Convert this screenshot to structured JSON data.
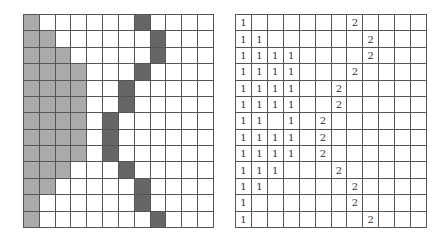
{
  "colors": {
    "grid_line": "#555555",
    "light_fill": "#aaaaaa",
    "dark_fill": "#666666",
    "background": "#ffffff"
  },
  "left_grid": {
    "cols": 12,
    "rows": 13,
    "legend": "L = light gray cell (region 1), D = dark gray cell (region 2 boundary)",
    "cells": [
      [
        "L",
        "",
        "",
        "",
        "",
        "",
        "",
        "D",
        "",
        "",
        "",
        ""
      ],
      [
        "L",
        "L",
        "",
        "",
        "",
        "",
        "",
        "",
        "D",
        "",
        "",
        ""
      ],
      [
        "L",
        "L",
        "L",
        "",
        "",
        "",
        "",
        "",
        "D",
        "",
        "",
        ""
      ],
      [
        "L",
        "L",
        "L",
        "L",
        "",
        "",
        "",
        "D",
        "",
        "",
        "",
        ""
      ],
      [
        "L",
        "L",
        "L",
        "L",
        "",
        "",
        "D",
        "",
        "",
        "",
        "",
        ""
      ],
      [
        "L",
        "L",
        "L",
        "L",
        "",
        "",
        "D",
        "",
        "",
        "",
        "",
        ""
      ],
      [
        "L",
        "L",
        "L",
        "L",
        "",
        "D",
        "",
        "",
        "",
        "",
        "",
        ""
      ],
      [
        "L",
        "L",
        "L",
        "L",
        "",
        "D",
        "",
        "",
        "",
        "",
        "",
        ""
      ],
      [
        "L",
        "L",
        "L",
        "L",
        "",
        "D",
        "",
        "",
        "",
        "",
        "",
        ""
      ],
      [
        "L",
        "L",
        "L",
        "",
        "",
        "",
        "D",
        "",
        "",
        "",
        "",
        ""
      ],
      [
        "L",
        "L",
        "",
        "",
        "",
        "",
        "",
        "D",
        "",
        "",
        "",
        ""
      ],
      [
        "L",
        "",
        "",
        "",
        "",
        "",
        "",
        "D",
        "",
        "",
        "",
        ""
      ],
      [
        "L",
        "",
        "",
        "",
        "",
        "",
        "",
        "",
        "D",
        "",
        "",
        ""
      ]
    ]
  },
  "right_grid": {
    "cols": 12,
    "rows": 13,
    "cells": [
      [
        "1",
        "",
        "",
        "",
        "",
        "",
        "",
        "2",
        "",
        "",
        "",
        ""
      ],
      [
        "1",
        "1",
        "",
        "",
        "",
        "",
        "",
        "",
        "2",
        "",
        "",
        ""
      ],
      [
        "1",
        "1",
        "1",
        "1",
        "",
        "",
        "",
        "",
        "2",
        "",
        "",
        ""
      ],
      [
        "1",
        "1",
        "1",
        "1",
        "",
        "",
        "",
        "2",
        "",
        "",
        "",
        ""
      ],
      [
        "1",
        "1",
        "1",
        "1",
        "",
        "",
        "2",
        "",
        "",
        "",
        "",
        ""
      ],
      [
        "1",
        "1",
        "1",
        "1",
        "",
        "",
        "2",
        "",
        "",
        "",
        "",
        ""
      ],
      [
        "1",
        "1",
        "",
        "1",
        "",
        "2",
        "",
        "",
        "",
        "",
        "",
        ""
      ],
      [
        "1",
        "1",
        "1",
        "1",
        "",
        "2",
        "",
        "",
        "",
        "",
        "",
        ""
      ],
      [
        "1",
        "1",
        "1",
        "1",
        "",
        "2",
        "",
        "",
        "",
        "",
        "",
        ""
      ],
      [
        "1",
        "1",
        "1",
        "",
        "",
        "",
        "2",
        "",
        "",
        "",
        "",
        ""
      ],
      [
        "1",
        "1",
        "",
        "",
        "",
        "",
        "",
        "2",
        "",
        "",
        "",
        ""
      ],
      [
        "1",
        "",
        "",
        "",
        "",
        "",
        "",
        "2",
        "",
        "",
        "",
        ""
      ],
      [
        "1",
        "",
        "",
        "",
        "",
        "",
        "",
        "",
        "2",
        "",
        "",
        ""
      ]
    ]
  }
}
